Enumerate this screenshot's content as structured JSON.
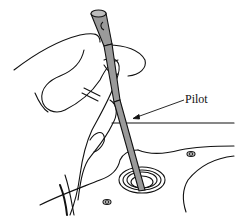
{
  "figure": {
    "labels": [
      {
        "id": "pilot",
        "text": "Pilot"
      }
    ],
    "colors": {
      "line": "#111111",
      "tool_fill": "#9a9a9a",
      "background": "#ffffff"
    }
  }
}
